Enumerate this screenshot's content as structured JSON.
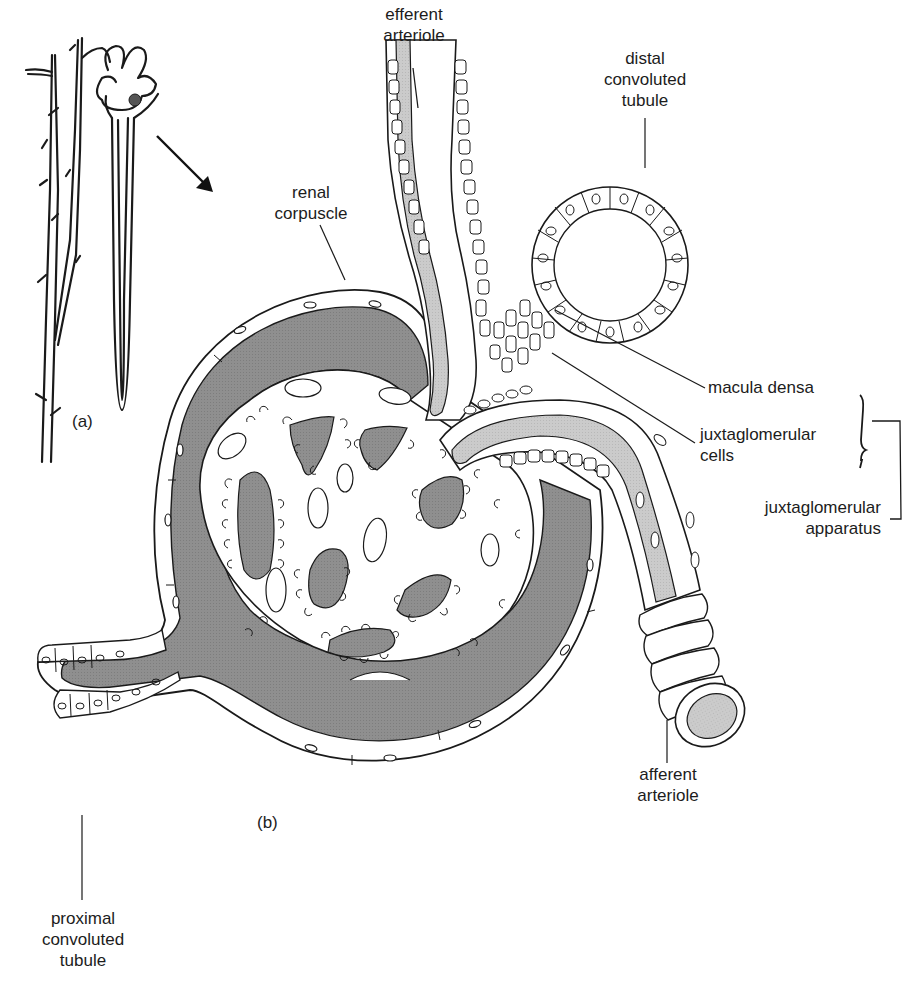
{
  "figure": {
    "panel_a_label": "(a)",
    "panel_b_label": "(b)",
    "colors": {
      "background": "#ffffff",
      "outline": "#1a1a1a",
      "capsular_space_fill": "#8f8f8f",
      "arteriole_lumen_fill": "#c9c9c9",
      "capillary_lumen_fill": "#8f8f8f"
    }
  },
  "labels": {
    "efferent_arteriole": {
      "line1": "efferent",
      "line2": "arteriole"
    },
    "distal_convoluted_tubule": {
      "line1": "distal",
      "line2": "convoluted",
      "line3": "tubule"
    },
    "renal_corpuscle": {
      "line1": "renal",
      "line2": "corpuscle"
    },
    "macula_densa": {
      "line1": "macula densa"
    },
    "juxtaglomerular_cells": {
      "line1": "juxtaglomerular",
      "line2": "cells"
    },
    "juxtaglomerular_apparatus": {
      "line1": "juxtaglomerular",
      "line2": "apparatus"
    },
    "afferent_arteriole": {
      "line1": "afferent",
      "line2": "arteriole"
    },
    "proximal_convoluted_tubule": {
      "line1": "proximal",
      "line2": "convoluted",
      "line3": "tubule"
    }
  }
}
